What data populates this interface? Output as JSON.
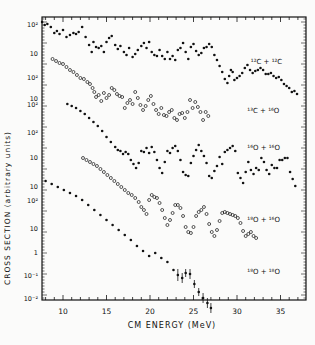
{
  "chart_data": {
    "type": "scatter",
    "title": "",
    "xlabel": "CM ENERGY (MeV)",
    "ylabel": "CROSS SECTION (arbitrary units)",
    "xlim": [
      7.5,
      37.5
    ],
    "x_ticks": [
      10,
      15,
      20,
      25,
      30,
      35
    ],
    "x_tick_labels": [
      "10",
      "15",
      "20",
      "25",
      "30",
      "35"
    ],
    "y_scale": "log (offset stacked series)",
    "y_tick_labels": [
      "10²",
      "10",
      "10²",
      "10",
      "10²",
      "10²",
      "10",
      "10",
      "10²",
      "10",
      "1",
      "10⁻¹",
      "10⁻²",
      "10⁻³"
    ],
    "grid": false,
    "legend_position": "inline labels at right",
    "series": [
      {
        "name": "¹²C + ¹²C",
        "marker": "filled",
        "label_pos": [
          33.2,
          64
        ],
        "x": [
          7.6,
          7.9,
          8.2,
          8.6,
          9.0,
          9.3,
          9.6,
          10.0,
          10.4,
          10.8,
          11.2,
          11.5,
          11.8,
          12.2,
          12.6,
          13.0,
          13.3,
          13.5,
          13.8,
          14.1,
          14.4,
          14.7,
          15.0,
          15.3,
          15.6,
          16.0,
          16.3,
          16.6,
          17.0,
          17.3,
          17.6,
          18.0,
          18.3,
          18.6,
          19.0,
          19.3,
          19.6,
          19.9,
          20.2,
          20.5,
          20.8,
          21.1,
          21.4,
          21.7,
          22.0,
          22.3,
          22.6,
          22.9,
          23.2,
          23.5,
          23.8,
          24.1,
          24.4,
          24.7,
          25.0,
          25.3,
          25.6,
          25.9,
          26.2,
          26.5,
          26.8,
          27.1,
          27.4,
          27.7,
          28.0,
          28.3,
          28.6,
          28.9,
          29.1,
          29.3,
          29.5,
          29.7,
          30.0,
          30.3,
          30.6,
          30.9,
          31.2,
          31.5,
          31.8,
          32.1,
          32.4,
          32.7,
          33.0,
          33.3,
          33.6,
          33.9,
          34.2,
          34.5,
          34.8,
          35.1,
          35.4,
          35.7,
          36.0,
          36.3,
          36.6,
          36.9
        ],
        "y_px": [
          22,
          25,
          24,
          27,
          33,
          31,
          34,
          30,
          37,
          35,
          33,
          34,
          32,
          27,
          37,
          45,
          52,
          42,
          47,
          48,
          46,
          52,
          42,
          38,
          36,
          45,
          49,
          46,
          52,
          55,
          48,
          57,
          54,
          50,
          46,
          43,
          48,
          42,
          52,
          55,
          56,
          50,
          56,
          59,
          52,
          59,
          56,
          60,
          50,
          48,
          43,
          52,
          59,
          47,
          44,
          51,
          55,
          53,
          48,
          47,
          44,
          47,
          55,
          60,
          66,
          72,
          79,
          83,
          76,
          70,
          72,
          80,
          78,
          76,
          73,
          68,
          65,
          70,
          73,
          71,
          70,
          68,
          70,
          74,
          74,
          73,
          76,
          78,
          77,
          80,
          84,
          86,
          88,
          92,
          91,
          94
        ]
      },
      {
        "name": "¹³C + ¹⁶O",
        "marker": "open",
        "label_pos": [
          32.8,
          113
        ],
        "x": [
          8.8,
          9.2,
          9.6,
          10.0,
          10.4,
          10.8,
          11.2,
          11.6,
          12.0,
          12.4,
          12.8,
          13.1,
          13.4,
          13.6,
          13.8,
          14.1,
          14.4,
          14.7,
          15.0,
          15.3,
          15.6,
          15.9,
          16.2,
          16.5,
          16.8,
          17.1,
          17.4,
          17.7,
          18.0,
          18.3,
          18.6,
          18.9,
          19.2,
          19.5,
          19.8,
          20.1,
          20.4,
          20.7,
          21.0,
          21.3,
          21.6,
          21.9,
          22.2,
          22.5,
          22.8,
          23.1,
          23.4,
          23.7,
          24.0,
          24.3,
          24.6,
          24.9,
          25.2,
          25.5,
          25.8,
          26.1,
          26.4,
          26.7
        ],
        "y_px": [
          59,
          61,
          63,
          64,
          67,
          70,
          72,
          75,
          78,
          79,
          82,
          84,
          88,
          92,
          97,
          95,
          101,
          93,
          98,
          95,
          88,
          90,
          94,
          96,
          97,
          108,
          103,
          100,
          104,
          92,
          98,
          105,
          110,
          106,
          100,
          96,
          104,
          110,
          114,
          108,
          115,
          116,
          112,
          110,
          118,
          120,
          114,
          113,
          118,
          112,
          100,
          108,
          102,
          107,
          112,
          120,
          112,
          116
        ]
      },
      {
        "name": "¹⁶O + ¹⁶O",
        "marker": "filled",
        "label_pos": [
          32.8,
          150
        ],
        "x": [
          10.5,
          11.0,
          11.5,
          12.0,
          12.5,
          13.0,
          13.5,
          14.0,
          14.5,
          15.0,
          15.5,
          16.0,
          16.3,
          16.6,
          16.9,
          17.2,
          17.5,
          17.8,
          18.1,
          18.4,
          18.7,
          19.0,
          19.3,
          19.6,
          19.9,
          20.2,
          20.5,
          20.8,
          21.1,
          21.4,
          21.7,
          22.0,
          22.3,
          22.6,
          22.9,
          23.2,
          23.5,
          23.8,
          24.1,
          24.4,
          24.7,
          25.0,
          25.3,
          25.6,
          25.9,
          26.2,
          26.5,
          26.8,
          27.1,
          27.4,
          27.7,
          28.0,
          28.3,
          28.6,
          28.9,
          29.2,
          29.5,
          29.8,
          30.1,
          30.4,
          30.7,
          31.0,
          31.3,
          31.6,
          31.9,
          32.2,
          32.5,
          32.8,
          33.1,
          33.4,
          33.7,
          34.0,
          34.3,
          34.6,
          34.9,
          35.2,
          35.5,
          35.8,
          36.1,
          36.4,
          36.7
        ],
        "y_px": [
          104,
          106,
          108,
          111,
          114,
          118,
          122,
          126,
          131,
          137,
          142,
          147,
          150,
          151,
          154,
          152,
          154,
          160,
          164,
          168,
          163,
          151,
          152,
          148,
          153,
          147,
          152,
          160,
          168,
          173,
          162,
          151,
          153,
          148,
          146,
          151,
          160,
          172,
          175,
          176,
          163,
          156,
          150,
          145,
          151,
          156,
          163,
          176,
          178,
          171,
          166,
          157,
          164,
          152,
          150,
          148,
          146,
          151,
          173,
          178,
          183,
          172,
          162,
          170,
          174,
          168,
          170,
          158,
          162,
          170,
          174,
          165,
          168,
          168,
          160,
          160,
          158,
          158,
          172,
          179,
          186
        ]
      },
      {
        "name": "¹⁸O + ¹⁶O",
        "marker": "open",
        "label_pos": [
          32.8,
          222
        ],
        "x": [
          12.3,
          12.7,
          13.1,
          13.5,
          13.9,
          14.3,
          14.7,
          15.1,
          15.5,
          15.9,
          16.3,
          16.7,
          17.1,
          17.5,
          17.9,
          18.3,
          18.7,
          19.0,
          19.3,
          19.6,
          19.9,
          20.2,
          20.5,
          20.8,
          21.1,
          21.4,
          21.7,
          22.0,
          22.3,
          22.6,
          22.9,
          23.2,
          23.5,
          23.8,
          24.1,
          24.4,
          24.7,
          25.0,
          25.3,
          25.6,
          25.9,
          26.2,
          26.5,
          26.8,
          27.1,
          27.4,
          27.7,
          28.0,
          28.3,
          28.6,
          28.9,
          29.2,
          29.5,
          29.8,
          30.1,
          30.4,
          30.7,
          31.0,
          31.3,
          31.6,
          31.9,
          32.2
        ],
        "y_px": [
          158,
          160,
          162,
          164,
          166,
          169,
          172,
          175,
          178,
          181,
          184,
          187,
          190,
          193,
          195,
          198,
          202,
          207,
          210,
          214,
          200,
          195,
          197,
          198,
          203,
          210,
          218,
          225,
          220,
          213,
          205,
          205,
          208,
          216,
          227,
          232,
          233,
          227,
          216,
          212,
          210,
          207,
          214,
          224,
          232,
          236,
          230,
          221,
          213,
          212,
          213,
          214,
          215,
          216,
          218,
          223,
          231,
          236,
          234,
          232,
          236,
          238
        ]
      },
      {
        "name": "¹⁸O + ¹⁸O",
        "marker": "filled",
        "error_bars": true,
        "label_pos": [
          32.8,
          274
        ],
        "x": [
          8.0,
          8.7,
          9.4,
          10.1,
          10.8,
          11.5,
          12.2,
          12.9,
          13.6,
          14.3,
          15.0,
          15.7,
          16.4,
          17.1,
          17.8,
          18.5,
          19.2,
          19.9,
          20.6,
          21.3,
          22.0,
          22.7,
          23.2,
          23.7,
          24.1,
          24.6,
          25.1,
          25.6,
          26.1,
          26.6,
          27.0
        ],
        "y_px": [
          181,
          184,
          187,
          190,
          193,
          196,
          200,
          205,
          210,
          215,
          220,
          225,
          230,
          235,
          240,
          246,
          251,
          256,
          253,
          258,
          262,
          270,
          275,
          278,
          273,
          274,
          284,
          292,
          298,
          303,
          308
        ],
        "y_err_px": [
          0,
          0,
          0,
          0,
          0,
          0,
          0,
          0,
          0,
          0,
          0,
          0,
          0,
          0,
          0,
          0,
          0,
          0,
          0,
          0,
          0,
          0,
          6,
          5,
          4,
          5,
          4,
          4,
          5,
          5,
          5
        ]
      }
    ]
  },
  "axis": {
    "x_title": "CM ENERGY (MeV)",
    "y_title": "CROSS SECTION (arbitrary units)"
  }
}
